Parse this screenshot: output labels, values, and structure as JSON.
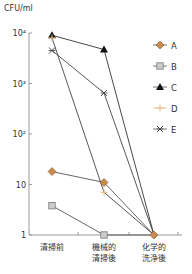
{
  "chart_data": {
    "type": "line",
    "title": "",
    "ylabel": "CFU/ml",
    "xlabel": "",
    "yscale": "log",
    "ylim": [
      1,
      10000
    ],
    "yticks": [
      {
        "value": 10000,
        "label": "10⁴"
      },
      {
        "value": 1000,
        "label": "10³"
      },
      {
        "value": 100,
        "label": "10²"
      },
      {
        "value": 10,
        "label": "10"
      },
      {
        "value": 1,
        "label": "1"
      }
    ],
    "categories": [
      {
        "lines": [
          "清掃前"
        ]
      },
      {
        "lines": [
          "機械的",
          "清掃後"
        ]
      },
      {
        "lines": [
          "化学的",
          "洗浄後"
        ]
      }
    ],
    "grid": false,
    "legend_position": "right",
    "series": [
      {
        "name": "A",
        "values": [
          18,
          11,
          1
        ],
        "marker": "diamond",
        "color": "#c98a4b",
        "line_color": "#555555"
      },
      {
        "name": "B",
        "values": [
          3.8,
          1,
          1
        ],
        "marker": "square",
        "color": "#cccccc",
        "line_color": "#555555"
      },
      {
        "name": "C",
        "values": [
          9000,
          4700,
          1
        ],
        "marker": "triangle",
        "color": "#111111",
        "line_color": "#333333"
      },
      {
        "name": "D",
        "values": [
          8000,
          7,
          1
        ],
        "marker": "plus",
        "color": "#e8b98a",
        "line_color": "#444444"
      },
      {
        "name": "E",
        "values": [
          4500,
          650,
          1
        ],
        "marker": "asterisk",
        "color": "#444444",
        "line_color": "#444444"
      }
    ]
  }
}
